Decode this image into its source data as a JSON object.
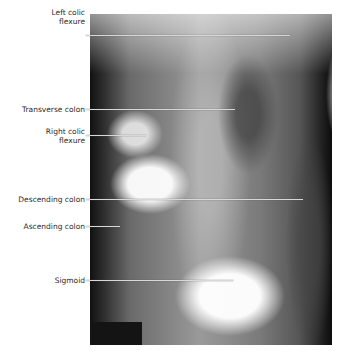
{
  "figure": {
    "type": "annotated-radiograph",
    "labels": [
      {
        "id": "left-colic-flexure",
        "line1": "Left colic",
        "line2": "flexure",
        "label_top": 8,
        "line_y": 35,
        "line_end_x": 290
      },
      {
        "id": "transverse-colon",
        "line1": "Transverse colon",
        "line2": "",
        "label_top": 105,
        "line_y": 109,
        "line_end_x": 235
      },
      {
        "id": "right-colic-flexure",
        "line1": "Right colic",
        "line2": "flexure",
        "label_top": 127,
        "line_y": 135,
        "line_end_x": 146
      },
      {
        "id": "descending-colon",
        "line1": "Descending colon",
        "line2": "",
        "label_top": 195,
        "line_y": 199,
        "line_end_x": 303
      },
      {
        "id": "ascending-colon",
        "line1": "Ascending colon",
        "line2": "",
        "label_top": 222,
        "line_y": 226,
        "line_end_x": 120
      },
      {
        "id": "sigmoid",
        "line1": "Sigmoid",
        "line2": "",
        "label_top": 276,
        "line_y": 280,
        "line_end_x": 233
      }
    ]
  },
  "colors": {
    "label_text": "#2b2b2b",
    "leader_line": "#d8d8d8",
    "background": "#ffffff"
  }
}
